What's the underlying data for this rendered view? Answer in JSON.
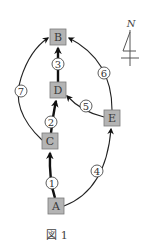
{
  "figure": {
    "caption": "図 1",
    "compass": {
      "label": "N"
    },
    "nodes": [
      {
        "id": "A",
        "label": "A"
      },
      {
        "id": "B",
        "label": "B"
      },
      {
        "id": "C",
        "label": "C"
      },
      {
        "id": "D",
        "label": "D"
      },
      {
        "id": "E",
        "label": "E"
      }
    ],
    "edges": [
      {
        "label": "1",
        "from": "A",
        "to": "C",
        "style": "thick"
      },
      {
        "label": "2",
        "from": "C",
        "to": "D",
        "style": "thick"
      },
      {
        "label": "3",
        "from": "D",
        "to": "B",
        "style": "thick"
      },
      {
        "label": "4",
        "from": "A",
        "to": "E",
        "style": "thin"
      },
      {
        "label": "5",
        "from": "E",
        "to": "D",
        "style": "thin"
      },
      {
        "label": "6",
        "from": "E",
        "to": "B",
        "style": "thin"
      },
      {
        "label": "7",
        "from": "C",
        "to": "B",
        "style": "thin"
      }
    ]
  }
}
